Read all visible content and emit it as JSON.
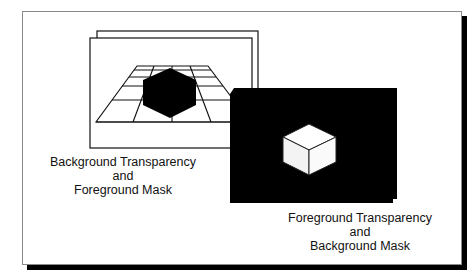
{
  "diagram": {
    "type": "illustration",
    "panels": [
      {
        "id": "left",
        "style": "white screen, black line grid floor, solid black hexagon object",
        "caption": [
          "Background Transparency",
          "and",
          "Foreground Mask"
        ]
      },
      {
        "id": "right",
        "style": "solid black screen, white cube object",
        "caption": [
          "Foreground Transparency",
          "and",
          "Background Mask"
        ]
      }
    ],
    "colors": {
      "ink": "#000000",
      "paper": "#ffffff",
      "border": "#8a8a8a"
    }
  }
}
